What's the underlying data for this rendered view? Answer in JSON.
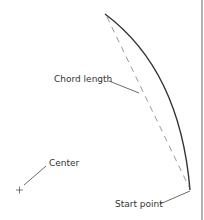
{
  "diagram": {
    "labels": {
      "chord_length": "Chord length",
      "center": "Center",
      "start_point": "Start point"
    },
    "colors": {
      "arc": "#333333",
      "chord": "#999999",
      "leader": "#444444",
      "border": "#666666"
    }
  }
}
